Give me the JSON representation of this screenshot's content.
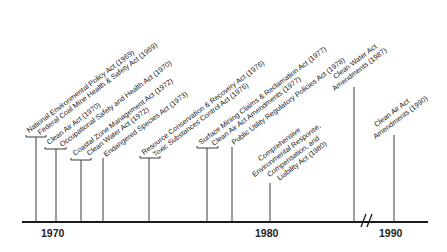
{
  "diagram": {
    "type": "timeline",
    "axis": {
      "year_labels": [
        "1970",
        "1980",
        "1990"
      ],
      "break_mark": "//"
    },
    "events": [
      {
        "label": "National Environmental Policy Act (1969)",
        "year": 1969
      },
      {
        "label": "Federal Coal Mine Health & Safety Act (1969)",
        "year": 1969
      },
      {
        "label": "Clean Air Act (1970)",
        "year": 1970
      },
      {
        "label": "Occupational Safety and Health Act (1970)",
        "year": 1970
      },
      {
        "label": "Coastal Zone Management Act (1972)",
        "year": 1972
      },
      {
        "label": "Clean Water Act (1972)",
        "year": 1972
      },
      {
        "label": "Endangered Species Act (1973)",
        "year": 1973
      },
      {
        "label": "Resource Conservation & Recovery Act (1976)",
        "year": 1976
      },
      {
        "label": "Toxic Substances Control Act (1976)",
        "year": 1976
      },
      {
        "label": "Surface Mining Claims & Reclamation Act (1977)",
        "year": 1977
      },
      {
        "label": "Clean Air Act Amendments (1977)",
        "year": 1977
      },
      {
        "label": "Public Utility Regulatory Policies Act (1978)",
        "year": 1978
      },
      {
        "label_lines": [
          "Comprehensive",
          "Environmental Response,",
          "Compensation, and",
          "Liability Act (1980)"
        ],
        "year": 1980
      },
      {
        "label_lines": [
          "Clean Water Act",
          "Amendments (1987)"
        ],
        "year": 1987
      },
      {
        "label_lines": [
          "Clean Air Act",
          "Amendments (1990)"
        ],
        "year": 1990
      }
    ]
  }
}
